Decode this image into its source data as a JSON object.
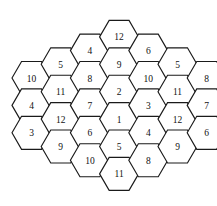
{
  "figure": {
    "name": "hexagonal-number-grid",
    "type": "hex-tiling",
    "orientation": "pointy-left-right-flat-top-bottom",
    "background_color": "#ffffff",
    "stroke_color": "#1a1a1a",
    "fill_color": "#ffffff",
    "text_color": "#111111",
    "total_cells": 30,
    "column_count": 7,
    "geometry": {
      "hex_width": 39,
      "hex_height": 33,
      "column_step_x": 29.2,
      "row_step_y": 27.4,
      "origin_x": 31.5,
      "origin_y": 78.0
    }
  },
  "columns": [
    {
      "index": 0,
      "name": "column-1-far-left",
      "cell_count": 3,
      "center_x": 31.5,
      "top_y": 78.0,
      "labels": [
        "10",
        "4",
        "3"
      ]
    },
    {
      "index": 1,
      "name": "column-2-left",
      "cell_count": 4,
      "center_x": 60.7,
      "top_y": 64.3,
      "labels": [
        "5",
        "11",
        "12",
        "9"
      ]
    },
    {
      "index": 2,
      "name": "column-3-center-left",
      "cell_count": 5,
      "center_x": 89.9,
      "top_y": 50.6,
      "labels": [
        "4",
        "8",
        "7",
        "6",
        "10"
      ]
    },
    {
      "index": 3,
      "name": "column-4-center",
      "cell_count": 6,
      "center_x": 119.1,
      "top_y": 36.9,
      "labels": [
        "12",
        "9",
        "2",
        "1",
        "5",
        "11"
      ]
    },
    {
      "index": 4,
      "name": "column-5-center-right",
      "cell_count": 5,
      "center_x": 148.3,
      "top_y": 50.6,
      "labels": [
        "6",
        "10",
        "3",
        "4",
        "8"
      ]
    },
    {
      "index": 5,
      "name": "column-6-right",
      "cell_count": 4,
      "center_x": 177.5,
      "top_y": 64.3,
      "labels": [
        "5",
        "11",
        "12",
        "9"
      ]
    },
    {
      "index": 6,
      "name": "column-7-far-right",
      "cell_count": 3,
      "center_x": 206.7,
      "top_y": 78.0,
      "labels": [
        "8",
        "7",
        "6"
      ]
    }
  ],
  "all_labels_reading_order": [
    "10",
    "4",
    "3",
    "5",
    "11",
    "12",
    "9",
    "4",
    "8",
    "7",
    "6",
    "10",
    "12",
    "9",
    "2",
    "1",
    "5",
    "11",
    "6",
    "10",
    "3",
    "4",
    "8",
    "5",
    "11",
    "12",
    "9",
    "8",
    "7",
    "6"
  ]
}
